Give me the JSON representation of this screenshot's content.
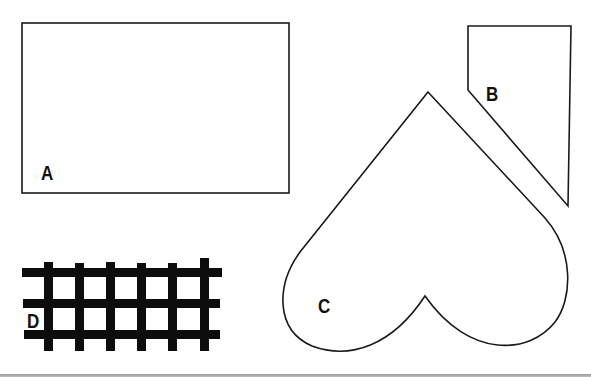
{
  "figure": {
    "shapes": [
      {
        "id": "A",
        "label": "A",
        "kind": "rectangle"
      },
      {
        "id": "B",
        "label": "B",
        "kind": "pentagon"
      },
      {
        "id": "C",
        "label": "C",
        "kind": "heart"
      },
      {
        "id": "D",
        "label": "D",
        "kind": "grid"
      }
    ]
  },
  "colors": {
    "stroke": "#1a1a1a",
    "fill": "#ffffff",
    "grid": "#0d0d0d",
    "rule": "#9a9a9a"
  }
}
